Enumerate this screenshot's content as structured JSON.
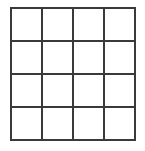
{
  "figure": {
    "name": "four-by-four-grid",
    "kind": "grid-diagram",
    "background_color": "#ffffff",
    "line_color": "#3a3a3a",
    "line_width_px": 2,
    "columns": 4,
    "rows": 4,
    "cell_label": "",
    "grid": [
      [
        "",
        "",
        "",
        ""
      ],
      [
        "",
        "",
        "",
        ""
      ],
      [
        "",
        "",
        "",
        ""
      ],
      [
        "",
        "",
        "",
        ""
      ]
    ]
  }
}
